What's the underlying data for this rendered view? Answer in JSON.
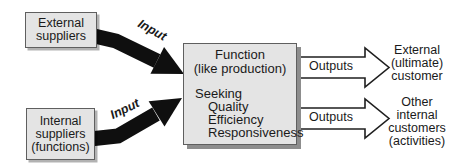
{
  "colors": {
    "background": "#ffffff",
    "box_fill": "#e4e4e4",
    "box_border": "#5f5f5f",
    "box_shadow": "#8d8d8d",
    "input_arrow": "#0f0f0f",
    "output_arrow_fill": "#ffffff",
    "output_arrow_outline": "#1f1f1f",
    "text": "#1a1a1a"
  },
  "boxes": {
    "external_suppliers": "External\nsuppliers",
    "internal_suppliers": "Internal\nsuppliers\n(functions)",
    "function": {
      "title": "Function\n(like production)",
      "seeking_label": "Seeking",
      "seeking_items": [
        "Quality",
        "Efficiency",
        "Responsiveness"
      ]
    }
  },
  "labels": {
    "input_top": "Input",
    "input_bottom": "Input",
    "outputs_top": "Outputs",
    "outputs_bottom": "Outputs"
  },
  "customers": {
    "external": "External\n(ultimate)\ncustomer",
    "internal_other": "Other\ninternal\ncustomers\n(activities)"
  }
}
